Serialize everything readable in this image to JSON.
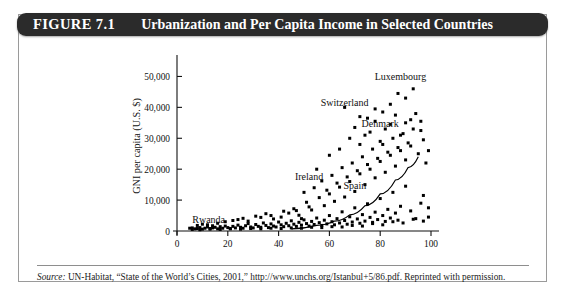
{
  "figure": {
    "number_label": "FIGURE 7.1",
    "title": "Urbanization and Per Capita Income in Selected Countries"
  },
  "source": {
    "label": "Source:",
    "text": " UN-Habitat, “State of the World’s Cities, 2001,” http://www.unchs.org/Istanbul+5/86.pdf. Reprinted with permission."
  },
  "colors": {
    "header_bg": "#2b2b2b",
    "header_text": "#ffffff",
    "frame_border": "#9a9a9a",
    "axis": "#111111",
    "marker": "#000000",
    "curve": "#000000",
    "background": "#ffffff"
  },
  "chart_data": {
    "type": "scatter",
    "title": "Urbanization and Per Capita Income in Selected Countries",
    "xlabel": "Urban population (% of total population)",
    "ylabel": "GNI per capita (U.S. $)",
    "xlim": [
      0,
      100
    ],
    "ylim": [
      0,
      55000
    ],
    "xticks": [
      0,
      20,
      40,
      60,
      80,
      100
    ],
    "xticklabels": [
      "0",
      "20",
      "40",
      "60",
      "80",
      "100"
    ],
    "yticks": [
      0,
      10000,
      20000,
      30000,
      40000,
      50000
    ],
    "yticklabels": [
      "0",
      "10,000",
      "20,000",
      "30,000",
      "40,000",
      "50,000"
    ],
    "grid": false,
    "legend": "none",
    "marker_shape": "square",
    "annotations": [
      {
        "text": "Rwanda",
        "x": 6,
        "y": 2600,
        "anchor": "start"
      },
      {
        "text": "Ireland",
        "x": 52,
        "y": 16500,
        "anchor": "middle"
      },
      {
        "text": "Spain",
        "x": 70,
        "y": 13500,
        "anchor": "middle"
      },
      {
        "text": "Denmark",
        "x": 80,
        "y": 33500,
        "anchor": "middle"
      },
      {
        "text": "Switzerland",
        "x": 66,
        "y": 40500,
        "anchor": "middle"
      },
      {
        "text": "Luxembourg",
        "x": 88,
        "y": 49000,
        "anchor": "middle"
      }
    ],
    "trend_curve": {
      "description": "exponential fit rising from near zero to about 24,000",
      "points": [
        [
          45,
          700
        ],
        [
          55,
          1800
        ],
        [
          62,
          3200
        ],
        [
          68,
          5200
        ],
        [
          74,
          8200
        ],
        [
          80,
          12000
        ],
        [
          86,
          16500
        ],
        [
          91,
          20500
        ],
        [
          95,
          24000
        ]
      ]
    },
    "points": [
      [
        5,
        900
      ],
      [
        6,
        1000
      ],
      [
        7,
        700
      ],
      [
        8,
        800
      ],
      [
        9,
        1100
      ],
      [
        10,
        600
      ],
      [
        11,
        900
      ],
      [
        12,
        1300
      ],
      [
        13,
        800
      ],
      [
        14,
        1000
      ],
      [
        15,
        1200
      ],
      [
        16,
        700
      ],
      [
        17,
        1400
      ],
      [
        18,
        900
      ],
      [
        19,
        1600
      ],
      [
        20,
        1100
      ],
      [
        21,
        800
      ],
      [
        22,
        1500
      ],
      [
        23,
        1000
      ],
      [
        24,
        1900
      ],
      [
        25,
        1200
      ],
      [
        26,
        900
      ],
      [
        27,
        1700
      ],
      [
        28,
        2400
      ],
      [
        29,
        1300
      ],
      [
        30,
        1000
      ],
      [
        31,
        2100
      ],
      [
        32,
        1500
      ],
      [
        33,
        1200
      ],
      [
        34,
        2600
      ],
      [
        35,
        1800
      ],
      [
        36,
        1100
      ],
      [
        37,
        2300
      ],
      [
        38,
        1600
      ],
      [
        39,
        1300
      ],
      [
        40,
        2900
      ],
      [
        41,
        2000
      ],
      [
        42,
        1400
      ],
      [
        43,
        2500
      ],
      [
        44,
        1700
      ],
      [
        45,
        3300
      ],
      [
        46,
        2200
      ],
      [
        47,
        1500
      ],
      [
        48,
        2800
      ],
      [
        49,
        1900
      ],
      [
        50,
        3600
      ],
      [
        51,
        2400
      ],
      [
        52,
        1600
      ],
      [
        53,
        3100
      ],
      [
        54,
        2100
      ],
      [
        55,
        4200
      ],
      [
        56,
        2700
      ],
      [
        57,
        1800
      ],
      [
        58,
        3500
      ],
      [
        59,
        2300
      ],
      [
        60,
        5000
      ],
      [
        61,
        3000
      ],
      [
        62,
        2000
      ],
      [
        63,
        4000
      ],
      [
        64,
        2600
      ],
      [
        65,
        6200
      ],
      [
        66,
        3400
      ],
      [
        67,
        2200
      ],
      [
        68,
        4600
      ],
      [
        69,
        2900
      ],
      [
        70,
        7500
      ],
      [
        71,
        3900
      ],
      [
        72,
        2500
      ],
      [
        73,
        5300
      ],
      [
        74,
        3200
      ],
      [
        75,
        8800
      ],
      [
        76,
        4400
      ],
      [
        77,
        2800
      ],
      [
        78,
        6100
      ],
      [
        79,
        3700
      ],
      [
        80,
        10500
      ],
      [
        81,
        5000
      ],
      [
        82,
        3100
      ],
      [
        83,
        7000
      ],
      [
        84,
        4200
      ],
      [
        85,
        12500
      ],
      [
        86,
        5800
      ],
      [
        87,
        3500
      ],
      [
        88,
        8000
      ],
      [
        90,
        14500
      ],
      [
        92,
        6500
      ],
      [
        94,
        4000
      ],
      [
        96,
        9000
      ],
      [
        97,
        11500
      ],
      [
        99,
        7500
      ],
      [
        22,
        3400
      ],
      [
        26,
        4100
      ],
      [
        31,
        4800
      ],
      [
        35,
        5600
      ],
      [
        38,
        3900
      ],
      [
        42,
        6400
      ],
      [
        46,
        7200
      ],
      [
        48,
        5100
      ],
      [
        51,
        9300
      ],
      [
        53,
        6800
      ],
      [
        56,
        10800
      ],
      [
        58,
        8200
      ],
      [
        60,
        12000
      ],
      [
        62,
        9600
      ],
      [
        64,
        14200
      ],
      [
        66,
        11000
      ],
      [
        68,
        16000
      ],
      [
        70,
        12800
      ],
      [
        72,
        18500
      ],
      [
        74,
        15000
      ],
      [
        76,
        20000
      ],
      [
        78,
        17200
      ],
      [
        80,
        22500
      ],
      [
        82,
        19000
      ],
      [
        84,
        24500
      ],
      [
        86,
        21000
      ],
      [
        88,
        26000
      ],
      [
        90,
        23000
      ],
      [
        92,
        27500
      ],
      [
        95,
        25000
      ],
      [
        50,
        12500
      ],
      [
        54,
        14000
      ],
      [
        57,
        16200
      ],
      [
        59,
        13200
      ],
      [
        61,
        18000
      ],
      [
        63,
        15500
      ],
      [
        65,
        20500
      ],
      [
        67,
        17500
      ],
      [
        69,
        22000
      ],
      [
        71,
        19500
      ],
      [
        73,
        24000
      ],
      [
        75,
        21500
      ],
      [
        77,
        26500
      ],
      [
        79,
        23500
      ],
      [
        81,
        28000
      ],
      [
        83,
        25500
      ],
      [
        85,
        30000
      ],
      [
        87,
        27000
      ],
      [
        89,
        31500
      ],
      [
        91,
        28500
      ],
      [
        93,
        33000
      ],
      [
        97,
        29500
      ],
      [
        99,
        26000
      ],
      [
        98,
        22000
      ],
      [
        55,
        20000
      ],
      [
        60,
        24500
      ],
      [
        64,
        26500
      ],
      [
        68,
        30000
      ],
      [
        72,
        28000
      ],
      [
        76,
        32000
      ],
      [
        80,
        29000
      ],
      [
        84,
        34500
      ],
      [
        88,
        31000
      ],
      [
        92,
        36000
      ],
      [
        96,
        32500
      ],
      [
        94,
        38000
      ],
      [
        90,
        35000
      ],
      [
        86,
        37500
      ],
      [
        82,
        33000
      ],
      [
        78,
        35500
      ],
      [
        74,
        31000
      ],
      [
        70,
        33500
      ],
      [
        66,
        40000
      ],
      [
        72,
        37000
      ],
      [
        78,
        39500
      ],
      [
        84,
        41000
      ],
      [
        90,
        43000
      ],
      [
        93,
        46000
      ],
      [
        96,
        35500
      ],
      [
        87,
        44500
      ],
      [
        81,
        38500
      ],
      [
        75,
        36500
      ],
      [
        12,
        2000
      ],
      [
        16,
        2500
      ],
      [
        19,
        3000
      ],
      [
        24,
        3700
      ],
      [
        28,
        3200
      ],
      [
        33,
        4400
      ],
      [
        37,
        5000
      ],
      [
        41,
        4500
      ],
      [
        44,
        5800
      ],
      [
        47,
        6600
      ],
      [
        49,
        4000
      ],
      [
        52,
        7800
      ],
      [
        8,
        1800
      ],
      [
        10,
        2200
      ],
      [
        14,
        1700
      ],
      [
        6,
        500
      ],
      [
        9,
        400
      ],
      [
        13,
        600
      ],
      [
        17,
        500
      ],
      [
        21,
        700
      ],
      [
        25,
        600
      ],
      [
        29,
        800
      ],
      [
        33,
        700
      ],
      [
        37,
        900
      ],
      [
        41,
        800
      ],
      [
        45,
        1000
      ],
      [
        49,
        900
      ],
      [
        53,
        1200
      ],
      [
        57,
        1100
      ],
      [
        61,
        1400
      ],
      [
        65,
        1300
      ],
      [
        69,
        1800
      ],
      [
        73,
        1600
      ],
      [
        77,
        2400
      ],
      [
        81,
        2000
      ],
      [
        85,
        3000
      ],
      [
        89,
        2600
      ],
      [
        93,
        3800
      ],
      [
        97,
        3200
      ],
      [
        99,
        4500
      ]
    ]
  }
}
